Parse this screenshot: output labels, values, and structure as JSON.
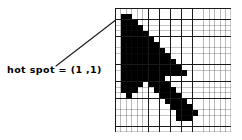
{
  "figure": {
    "caption_text": "hot spot = (1 ,1)",
    "annotation": {
      "label": "hot spot = (1 ,1)",
      "hot_spot_coordinates": "(1 ,1)",
      "hot_spot_col": 1,
      "hot_spot_row": 1
    },
    "leader_line": {
      "from_x": 56,
      "from_y": 66,
      "to_x": 131,
      "to_y": 9,
      "color": "#1a1a1a",
      "width": 1
    },
    "grid": {
      "columns": 21,
      "rows": 22,
      "cell_px": 5.5,
      "line_color": "#1a1a1a",
      "fill_color": "#000000",
      "empty_color": "#ffffff",
      "bitmap_name": "arrow-cursor-bitmap",
      "bitmap_rows": [
        "000000000000000000000",
        "011000000000000000000",
        "011100000000000000000",
        "011110000000000000000",
        "011111000000000000000",
        "011111100000000000000",
        "011111110000000000000",
        "011111111000000000000",
        "011111111100000000000",
        "011111111110000000000",
        "011111111111000000000",
        "011111111111100000000",
        "011111111000000000000",
        "011110111100000000000",
        "011100011110000000000",
        "001000001111000000000",
        "000000000111100000000",
        "000000000011110000000",
        "000000000001111000000",
        "000000000001110000000",
        "000000000000000000000",
        "000000000000000000000"
      ]
    }
  },
  "colors": {
    "ink": "#000000",
    "grid_line": "#1a1a1a",
    "paper": "#ffffff"
  }
}
